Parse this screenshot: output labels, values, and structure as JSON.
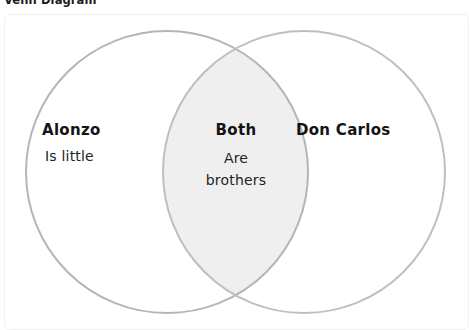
{
  "page": {
    "title": "Venn Diagram",
    "background_color": "#ffffff"
  },
  "card": {
    "border_color": "#f1f1f1",
    "background_color": "#ffffff"
  },
  "diagram": {
    "type": "venn",
    "sets": 2,
    "stroke_color": "#b5b5b5",
    "stroke_width": 2,
    "set_fill_color": "#ffffff",
    "intersection_fill_color": "#efefef",
    "left_circle": {
      "cx": 167,
      "cy": 172,
      "r": 141
    },
    "right_circle": {
      "cx": 304,
      "cy": 172,
      "r": 141
    }
  },
  "regions": {
    "left": {
      "heading": "Alonzo",
      "lines": [
        "Is little"
      ]
    },
    "center": {
      "heading": "Both",
      "lines": [
        "Are",
        "brothers"
      ]
    },
    "right": {
      "heading": "Don Carlos",
      "lines": []
    }
  }
}
